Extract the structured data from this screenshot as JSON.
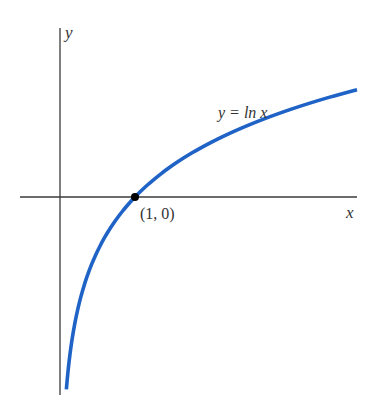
{
  "chart_data": {
    "type": "line",
    "title": "",
    "xlabel": "x",
    "ylabel": "y",
    "series": [
      {
        "name": "y = ln x",
        "function": "ln(x)",
        "color": "#1f63c6",
        "x": [
          0.085,
          0.1,
          0.15,
          0.2,
          0.3,
          0.4,
          0.5,
          0.6,
          0.8,
          1.0,
          1.25,
          1.5,
          2.0,
          2.5,
          3.0,
          3.5,
          3.96
        ],
        "values": [
          -2.46,
          -2.3,
          -1.9,
          -1.61,
          -1.2,
          -0.92,
          -0.69,
          -0.51,
          -0.22,
          0.0,
          0.22,
          0.41,
          0.69,
          0.92,
          1.1,
          1.25,
          1.38
        ]
      }
    ],
    "annotations": [
      {
        "text": "(1, 0)",
        "x": 1,
        "y": 0,
        "marker": "filled-dot"
      },
      {
        "text": "y = ln x",
        "x": 2.45,
        "y": 1.1
      }
    ],
    "xlim": [
      -0.53,
      3.96
    ],
    "ylim": [
      -2.54,
      2.17
    ],
    "grid": false,
    "ticks": false,
    "legend": null
  },
  "labels": {
    "x_axis": "x",
    "y_axis": "y",
    "curve": "y = ln x",
    "point": "(1, 0)"
  },
  "colors": {
    "curve": "#1f63c6",
    "axes": "#3a3a3a",
    "point": "#000000",
    "text": "#333333"
  }
}
